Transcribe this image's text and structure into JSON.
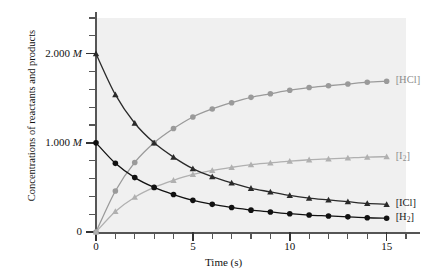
{
  "chart_data": {
    "type": "line",
    "title": "",
    "xlabel": "Time (s)",
    "ylabel": "Concentrations of reactants and products",
    "xlim": [
      0,
      16
    ],
    "ylim": [
      0,
      2.4
    ],
    "grid": false,
    "legend_position": "right-of-line-ends",
    "background": "#f0f0f0",
    "x_ticks_labeled": [
      {
        "value": 0,
        "label": "0"
      },
      {
        "value": 5,
        "label": "5"
      },
      {
        "value": 10,
        "label": "10"
      },
      {
        "value": 15,
        "label": "15"
      }
    ],
    "x_ticks_minor": [
      1,
      2,
      3,
      4,
      6,
      7,
      8,
      9,
      11,
      12,
      13,
      14,
      16
    ],
    "y_ticks_labeled": [
      {
        "value": 0.0,
        "label": "0",
        "italic_unit": ""
      },
      {
        "value": 1.0,
        "label": "1.000",
        "italic_unit": "M"
      },
      {
        "value": 2.0,
        "label": "2.000",
        "italic_unit": "M"
      }
    ],
    "y_ticks_minor": [
      0.2,
      0.4,
      0.6,
      0.8,
      1.2,
      1.4,
      1.6,
      1.8,
      2.2,
      2.4
    ],
    "x": [
      0,
      1,
      2,
      3,
      4,
      5,
      6,
      7,
      8,
      9,
      10,
      11,
      12,
      13,
      14,
      15
    ],
    "series": [
      {
        "name": "[HCl]",
        "label": "[HCl]",
        "color": "#9a9a9a",
        "marker": "circle",
        "values": [
          0.0,
          0.46,
          0.78,
          1.0,
          1.16,
          1.29,
          1.38,
          1.45,
          1.51,
          1.55,
          1.59,
          1.62,
          1.64,
          1.66,
          1.68,
          1.69
        ]
      },
      {
        "name": "[I2]",
        "label": "[I₂]",
        "label_base": "[I",
        "label_sub": "2",
        "label_tail": "]",
        "color": "#b0b0b0",
        "marker": "triangle",
        "values": [
          0.0,
          0.23,
          0.39,
          0.5,
          0.58,
          0.645,
          0.69,
          0.725,
          0.755,
          0.775,
          0.795,
          0.81,
          0.82,
          0.83,
          0.84,
          0.845
        ]
      },
      {
        "name": "[ICl]",
        "label": "[ICl]",
        "color": "#2a2a2a",
        "marker": "triangle",
        "values": [
          2.0,
          1.54,
          1.22,
          1.0,
          0.84,
          0.71,
          0.62,
          0.55,
          0.49,
          0.45,
          0.41,
          0.38,
          0.36,
          0.34,
          0.32,
          0.31
        ]
      },
      {
        "name": "[H2]",
        "label": "[H₂]",
        "label_base": "[H",
        "label_sub": "2",
        "label_tail": "]",
        "color": "#111111",
        "marker": "circle",
        "values": [
          1.0,
          0.77,
          0.61,
          0.5,
          0.42,
          0.355,
          0.31,
          0.275,
          0.245,
          0.225,
          0.205,
          0.19,
          0.18,
          0.17,
          0.16,
          0.155
        ]
      }
    ]
  },
  "axis_titles": {
    "y": "Concentrations of reactants and products",
    "x": "Time (s)"
  }
}
